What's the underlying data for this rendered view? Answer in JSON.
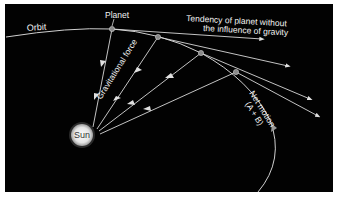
{
  "diagram": {
    "labels": {
      "orbit": "Orbit",
      "planet": "Planet",
      "tendency_line1": "Tendency of planet without",
      "tendency_line2": "the influence of gravity",
      "gravitational_force": "Gravitational force",
      "net_motion_line1": "Net motion",
      "net_motion_line2": "(A + B)",
      "sun": "Sun"
    },
    "colors": {
      "background": "#020202",
      "lines": "#d8d8d8",
      "text": "#f2f2f2",
      "sun": "#e6e6e6",
      "planet": "#8a8a8a",
      "border": "#ffffff"
    },
    "nodes": [
      {
        "id": "sun",
        "label": "Sun",
        "x": 82,
        "y": 135
      },
      {
        "id": "planet-1",
        "x": 112,
        "y": 29
      },
      {
        "id": "planet-2",
        "x": 158,
        "y": 37
      },
      {
        "id": "planet-3",
        "x": 201,
        "y": 53
      },
      {
        "id": "planet-4",
        "x": 236,
        "y": 72
      }
    ],
    "edges": [
      {
        "from": "planet-1",
        "to": "sun",
        "type": "gravitational-force"
      },
      {
        "from": "planet-2",
        "to": "sun",
        "type": "gravitational-force"
      },
      {
        "from": "planet-3",
        "to": "sun",
        "type": "gravitational-force"
      },
      {
        "from": "planet-4",
        "to": "sun",
        "type": "gravitational-force"
      },
      {
        "from": "planet-1",
        "to": "tangent-1",
        "type": "inertial-tendency"
      },
      {
        "from": "planet-2",
        "to": "tangent-2",
        "type": "inertial-tendency"
      },
      {
        "from": "planet-3",
        "to": "tangent-3",
        "type": "inertial-tendency"
      },
      {
        "from": "planet-4",
        "to": "tangent-4",
        "type": "inertial-tendency"
      }
    ]
  }
}
